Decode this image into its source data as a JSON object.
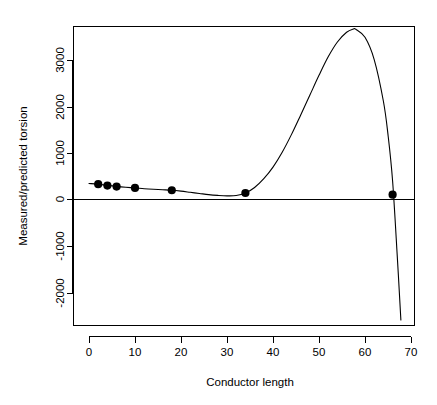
{
  "chart_data": {
    "type": "scatter",
    "title": "",
    "subtitle": "",
    "xlabel": "Conductor length",
    "ylabel": "Measured/predicted torsion",
    "xlim": [
      -1.5,
      71.5
    ],
    "ylim": [
      -2750,
      3900
    ],
    "xticks": [
      0,
      10,
      20,
      30,
      40,
      50,
      60,
      70
    ],
    "yticks": [
      -2000,
      -1000,
      0,
      1000,
      2000,
      3000
    ],
    "xtick_labels": [
      "0",
      "10",
      "20",
      "30",
      "40",
      "50",
      "60",
      "70"
    ],
    "ytick_labels": [
      "-2000",
      "-1000",
      "0",
      "1000",
      "2000",
      "3000"
    ],
    "grid": false,
    "legend": null,
    "zero_reference_line": 0,
    "points": {
      "name": "Measured/predicted torsion observations",
      "x": [
        2,
        4,
        6,
        10,
        18,
        34,
        66
      ],
      "y": [
        330,
        300,
        280,
        250,
        200,
        140,
        105
      ]
    },
    "series": [
      {
        "name": "Fitted polynomial curve",
        "type": "line",
        "x": [
          0,
          2,
          4,
          6,
          8,
          10,
          12,
          14,
          16,
          18,
          20,
          22,
          24,
          26,
          28,
          30,
          32,
          34,
          36,
          38,
          40,
          42,
          44,
          46,
          48,
          50,
          52,
          54,
          56,
          57.5,
          58,
          60,
          62,
          64,
          65,
          66,
          67,
          67.8
        ],
        "y": [
          345,
          330,
          305,
          283,
          265,
          250,
          233,
          220,
          210,
          200,
          180,
          155,
          130,
          105,
          88,
          78,
          85,
          140,
          260,
          450,
          700,
          1020,
          1400,
          1820,
          2250,
          2680,
          3080,
          3400,
          3610,
          3680,
          3675,
          3500,
          3020,
          2120,
          1400,
          400,
          -1200,
          -2600
        ]
      }
    ],
    "annotations": []
  },
  "axes": {
    "x_axis_name": "x-axis",
    "y_axis_name": "y-axis",
    "box_style": "L-shaped axes with outer frame"
  }
}
